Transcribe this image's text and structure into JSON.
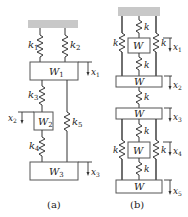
{
  "figure_a": {
    "caption": "(a)",
    "springs": [
      {
        "id": "k1",
        "label": "k",
        "sub": "1"
      },
      {
        "id": "k2",
        "label": "k",
        "sub": "2"
      },
      {
        "id": "k3",
        "label": "k",
        "sub": "3"
      },
      {
        "id": "k4",
        "label": "k",
        "sub": "4"
      },
      {
        "id": "k5",
        "label": "k",
        "sub": "5"
      }
    ],
    "masses": [
      {
        "id": "W1",
        "label": "W",
        "sub": "1"
      },
      {
        "id": "W2",
        "label": "W",
        "sub": "2"
      },
      {
        "id": "W3",
        "label": "W",
        "sub": "3"
      }
    ],
    "displacements": [
      {
        "id": "x1",
        "label": "x",
        "sub": "1"
      },
      {
        "id": "x2",
        "label": "x",
        "sub": "2"
      },
      {
        "id": "x3",
        "label": "x",
        "sub": "3"
      }
    ]
  },
  "figure_b": {
    "caption": "(b)",
    "spring_label": "k",
    "mass_label": "W",
    "displacements": [
      {
        "id": "x1",
        "label": "x",
        "sub": "1"
      },
      {
        "id": "x2",
        "label": "x",
        "sub": "2"
      },
      {
        "id": "x3",
        "label": "x",
        "sub": "3"
      },
      {
        "id": "x4",
        "label": "x",
        "sub": "4"
      },
      {
        "id": "x5",
        "label": "x",
        "sub": "5"
      }
    ]
  },
  "colors": {
    "ground": "#c8c8c8",
    "stroke": "#333333",
    "background": "#ffffff"
  }
}
